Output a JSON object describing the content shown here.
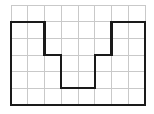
{
  "figure": {
    "name": "grid-polygon-figure",
    "background_color": "#ffffff",
    "canvas": {
      "width": 154,
      "height": 114
    }
  },
  "grid": {
    "name": "square-grid",
    "origin_x": 11,
    "origin_y": 5,
    "cell_width": 16.75,
    "cell_height": 16.667,
    "columns": 8,
    "rows": 6,
    "line_color": "#c9c9c9",
    "line_width": 1,
    "border_color": "#c9c9c9",
    "border_width": 1
  },
  "shape": {
    "name": "notched-rectangle-outline",
    "description": "Rectangle outline spanning 8 grid columns and 5 grid rows with a 2-column by 2-row notch removed from the bottom center",
    "stroke_color": "#1a1a1a",
    "stroke_width": 2.2,
    "fill": "none",
    "vertices_in_cells": [
      [
        0,
        1
      ],
      [
        2,
        1
      ],
      [
        2,
        3
      ],
      [
        3,
        3
      ],
      [
        3,
        5
      ],
      [
        5,
        5
      ],
      [
        5,
        3
      ],
      [
        6,
        3
      ],
      [
        6,
        1
      ],
      [
        8,
        1
      ],
      [
        8,
        6
      ],
      [
        0,
        6
      ]
    ],
    "closed": true,
    "area_in_cells": 36,
    "perimeter_in_cells": 30
  },
  "chart_data": {
    "type": "table",
    "title": "",
    "xlabel": "",
    "ylabel": "",
    "categories": [
      "columns",
      "rows"
    ],
    "values": [
      8,
      6
    ],
    "grid": true,
    "legend_position": "none",
    "annotations": [],
    "polygon_vertices": [
      [
        0,
        1
      ],
      [
        2,
        1
      ],
      [
        2,
        3
      ],
      [
        3,
        3
      ],
      [
        3,
        5
      ],
      [
        5,
        5
      ],
      [
        5,
        3
      ],
      [
        6,
        3
      ],
      [
        6,
        1
      ],
      [
        8,
        1
      ],
      [
        8,
        6
      ],
      [
        0,
        6
      ]
    ]
  }
}
